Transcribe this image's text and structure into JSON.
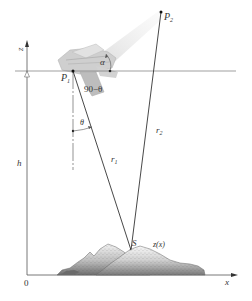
{
  "figure": {
    "type": "geometry diagram"
  },
  "axes": {
    "z_label": "z",
    "x_label": "x",
    "origin_label": "0"
  },
  "points": {
    "p1": {
      "label": "P",
      "sub": "1"
    },
    "p2": {
      "label": "P",
      "sub": "2"
    },
    "s": {
      "label": "S"
    }
  },
  "labels": {
    "alpha": "α",
    "ninety_minus_theta": "90−θ",
    "theta": "θ",
    "r1": {
      "label": "r",
      "sub": "1"
    },
    "r2": {
      "label": "r",
      "sub": "2"
    },
    "h": "h",
    "terrain": "z(x)"
  },
  "colors": {
    "line": "#333333",
    "horizon": "#777777",
    "aircraft": "#c8c8c8",
    "terrain_light": "#e6e6e6",
    "terrain_dark": "#8a8a8a"
  }
}
